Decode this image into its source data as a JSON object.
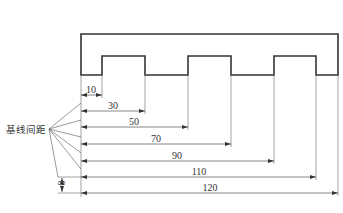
{
  "diagram": {
    "annotation_label": "基线间距",
    "spacing_label": "8",
    "dimensions": [
      {
        "value": "10",
        "y": 95,
        "x_end": 102,
        "label_x": 91
      },
      {
        "value": "30",
        "y": 111,
        "x_end": 145,
        "label_x": 113
      },
      {
        "value": "50",
        "y": 127,
        "x_end": 188,
        "label_x": 134
      },
      {
        "value": "70",
        "y": 144,
        "x_end": 231,
        "label_x": 156
      },
      {
        "value": "90",
        "y": 161,
        "x_end": 274,
        "label_x": 177
      },
      {
        "value": "110",
        "y": 177,
        "x_end": 316,
        "label_x": 199
      },
      {
        "value": "120",
        "y": 193,
        "x_end": 338,
        "label_x": 210
      }
    ],
    "colors": {
      "stroke": "#333333",
      "thin": "#555555",
      "background": "#ffffff"
    }
  }
}
